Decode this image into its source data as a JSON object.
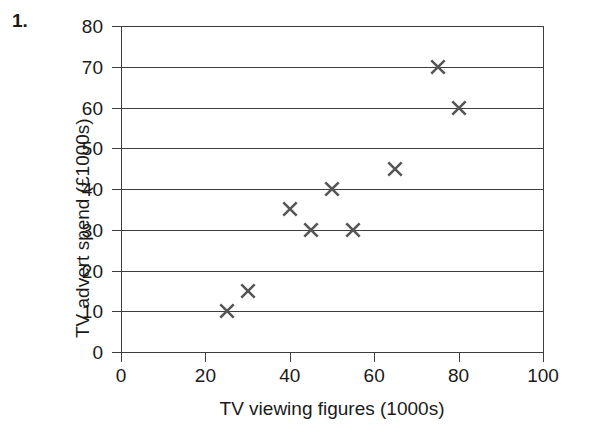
{
  "question": {
    "number": "1."
  },
  "chart_data": {
    "type": "scatter",
    "title": "",
    "xlabel": "TV viewing figures (1000s)",
    "ylabel": "TV advert spend (£1000s)",
    "xlim": [
      0,
      100
    ],
    "ylim": [
      0,
      80
    ],
    "xticks": [
      "0",
      "20",
      "40",
      "60",
      "80",
      "100"
    ],
    "xtick_values": [
      0,
      20,
      40,
      60,
      80,
      100
    ],
    "yticks": [
      "0",
      "10",
      "20",
      "30",
      "40",
      "50",
      "60",
      "70",
      "80"
    ],
    "ytick_values": [
      0,
      10,
      20,
      30,
      40,
      50,
      60,
      70,
      80
    ],
    "grid": "horizontal",
    "legend": null,
    "marker": "x-cross",
    "marker_color": "#555555",
    "axis_color": "#3d3d3d",
    "background": "#ffffff",
    "x": [
      25,
      30,
      40,
      45,
      50,
      55,
      65,
      75,
      80
    ],
    "y": [
      10,
      15,
      35,
      30,
      40,
      30,
      45,
      70,
      60
    ],
    "points": [
      {
        "x": 25,
        "y": 10
      },
      {
        "x": 30,
        "y": 15
      },
      {
        "x": 40,
        "y": 35
      },
      {
        "x": 45,
        "y": 30
      },
      {
        "x": 50,
        "y": 40
      },
      {
        "x": 55,
        "y": 30
      },
      {
        "x": 65,
        "y": 45
      },
      {
        "x": 75,
        "y": 70
      },
      {
        "x": 80,
        "y": 60
      }
    ]
  }
}
